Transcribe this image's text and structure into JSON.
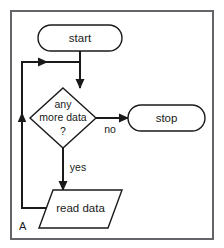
{
  "figure": {
    "corner_label": "A",
    "background_color": "#ffffff",
    "border_color": "#63656a",
    "line_color": "#1a1a1a"
  },
  "nodes": {
    "start": {
      "label": "start",
      "shape": "terminator"
    },
    "decision": {
      "shape": "diamond",
      "line1": "any",
      "line2": "more data",
      "line3": "?"
    },
    "stop": {
      "label": "stop",
      "shape": "terminator"
    },
    "read_data": {
      "label": "read data",
      "shape": "parallelogram"
    }
  },
  "edges": {
    "no_label": "no",
    "yes_label": "yes"
  }
}
